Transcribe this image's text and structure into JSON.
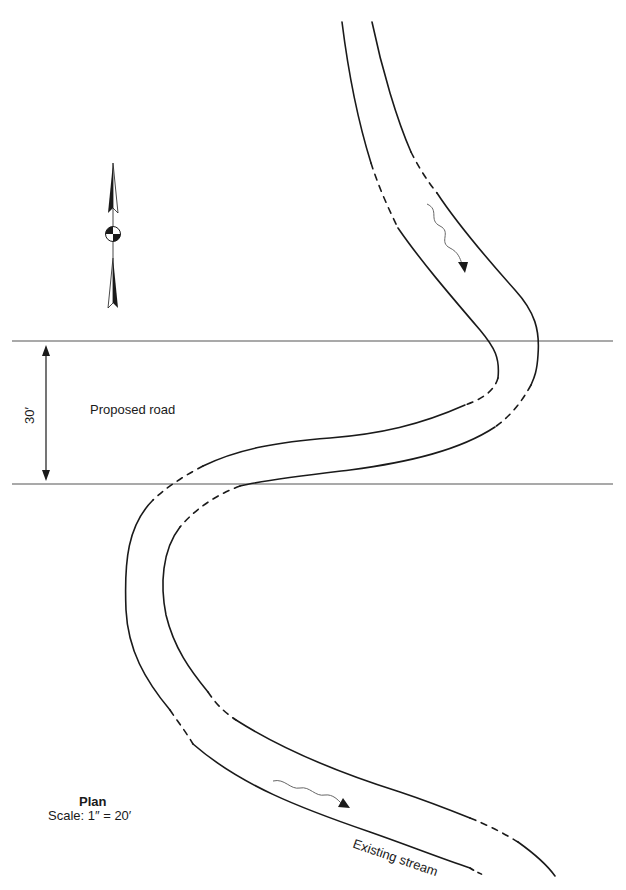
{
  "diagram": {
    "type": "site plan",
    "road": {
      "label": "Proposed road",
      "width_label": "30′"
    },
    "stream": {
      "label": "Existing stream"
    },
    "plan": {
      "title": "Plan",
      "scale": "Scale: 1″ = 20′"
    },
    "north_arrow": {
      "icon": "north-arrow-icon"
    },
    "colors": {
      "line": "#1a1a1a",
      "road_line": "#555555",
      "flow_line": "#666666",
      "background": "#ffffff"
    }
  }
}
